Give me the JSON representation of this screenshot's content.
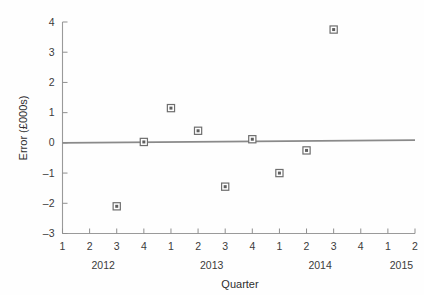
{
  "chart_data": {
    "type": "scatter",
    "title": "",
    "xlabel": "Quarter",
    "ylabel": "Error (£000s)",
    "ylim": [
      -3,
      4
    ],
    "ytick_labels": [
      "4",
      "3",
      "2",
      "1",
      "0",
      "–1",
      "–2",
      "–3"
    ],
    "ytick_values": [
      4,
      3,
      2,
      1,
      0,
      -1,
      -2,
      -3
    ],
    "grid": false,
    "legend": "none",
    "x_axis": {
      "tick_labels": [
        "1",
        "2",
        "3",
        "4",
        "1",
        "2",
        "3",
        "4",
        "1",
        "2",
        "3",
        "4",
        "1",
        "2"
      ],
      "group_labels": [
        "2012",
        "2013",
        "2014",
        "2015"
      ],
      "groups": [
        {
          "year": "2012",
          "quarters": [
            "1",
            "2",
            "3",
            "4"
          ]
        },
        {
          "year": "2013",
          "quarters": [
            "1",
            "2",
            "3",
            "4"
          ]
        },
        {
          "year": "2014",
          "quarters": [
            "1",
            "2",
            "3",
            "4"
          ]
        },
        {
          "year": "2015",
          "quarters": [
            "1",
            "2"
          ]
        }
      ]
    },
    "points": [
      {
        "index": 2,
        "label": "2012 Q3",
        "x": 3,
        "y": -2.1
      },
      {
        "index": 3,
        "label": "2012 Q4",
        "x": 4,
        "y": 0.03
      },
      {
        "index": 4,
        "label": "2013 Q1",
        "x": 5,
        "y": 1.15
      },
      {
        "index": 5,
        "label": "2013 Q2",
        "x": 6,
        "y": 0.4
      },
      {
        "index": 6,
        "label": "2013 Q3",
        "x": 7,
        "y": -1.45
      },
      {
        "index": 7,
        "label": "2013 Q4",
        "x": 8,
        "y": 0.12
      },
      {
        "index": 8,
        "label": "2014 Q1",
        "x": 9,
        "y": -1.0
      },
      {
        "index": 9,
        "label": "2014 Q2",
        "x": 10,
        "y": -0.25
      },
      {
        "index": 10,
        "label": "2014 Q3",
        "x": 11,
        "y": 3.75
      }
    ],
    "trend_line": {
      "name": "zero/trend reference line",
      "x_start": 1,
      "x_end": 14,
      "y_start": 0.0,
      "y_end": 0.09
    },
    "colors": {
      "marker_edge": "#6e6e6e",
      "marker_fill": "#ffffff",
      "marker_center": "#5f5f5f",
      "axis": "#9a9a9a",
      "trend": "#8a8a8a",
      "text": "#3b3b3b",
      "background": "#fefefe"
    }
  }
}
